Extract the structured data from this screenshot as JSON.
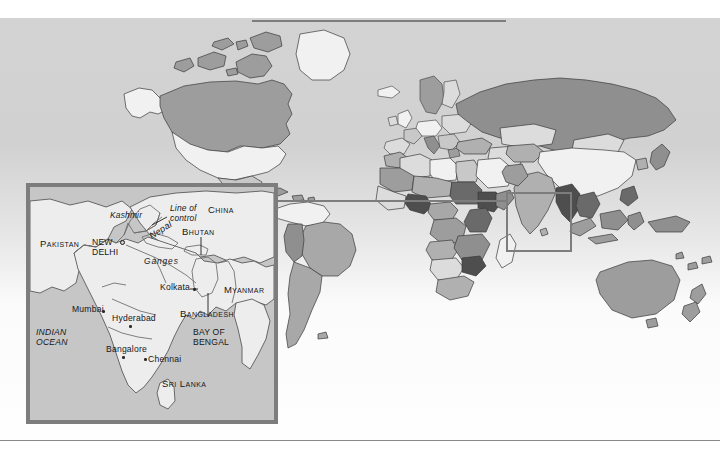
{
  "figure": {
    "kind": "locator-map-with-inset",
    "background_color": "#fafafa",
    "frame_color": "#7d7d7d"
  },
  "world_map": {
    "name": "world-choropleth",
    "ocean_color": "#e8e8e8",
    "outline_color": "#3a3a3a",
    "highlight_box": {
      "label": "south-asia-highlight",
      "x": 506,
      "y": 174,
      "w": 66,
      "h": 60,
      "color": "#7d7d7d"
    },
    "connector": {
      "label": "inset-connector-line",
      "color": "#7d7d7d"
    },
    "shades": {
      "lightest": "#f2f2f2",
      "light": "#dcdcdc",
      "medium": "#b4b4b4",
      "dark": "#8e8e8e",
      "darkest": "#6a6a6a"
    }
  },
  "inset": {
    "title": "South Asia detail",
    "land_color": "#efefef",
    "sea_color": "#c6c6c6",
    "border_color": "#7d7d7d",
    "labels": [
      {
        "id": "pakistan",
        "text": "Pakistan",
        "style": "caps",
        "x": 10,
        "y": 57
      },
      {
        "id": "kashmir",
        "text": "Kashmir",
        "style": "ital",
        "x": 82,
        "y": 28
      },
      {
        "id": "line-of-control",
        "text": "Line of\ncontrol",
        "style": "ital",
        "x": 139,
        "y": 20
      },
      {
        "id": "china",
        "text": "China",
        "style": "caps",
        "x": 177,
        "y": 21
      },
      {
        "id": "new-delhi",
        "text": "NEW\nDELHI",
        "style": "plain",
        "x": 64,
        "y": 53
      },
      {
        "id": "nepal",
        "text": "Nepal",
        "style": "ital",
        "x": 121,
        "y": 50
      },
      {
        "id": "bhutan",
        "text": "Bhutan",
        "style": "caps",
        "x": 160,
        "y": 44
      },
      {
        "id": "ganges",
        "text": "Ganges",
        "style": "ital",
        "x": 119,
        "y": 72
      },
      {
        "id": "kolkata",
        "text": "Kolkata",
        "style": "plain",
        "x": 134,
        "y": 98
      },
      {
        "id": "myanmar",
        "text": "Myanmar",
        "style": "caps",
        "x": 196,
        "y": 102
      },
      {
        "id": "bangladesh",
        "text": "Bangladesh",
        "style": "caps",
        "x": 156,
        "y": 125
      },
      {
        "id": "mumbai",
        "text": "Mumbai",
        "style": "plain",
        "x": 44,
        "y": 119
      },
      {
        "id": "hyderabad",
        "text": "Hyderabad",
        "style": "plain",
        "x": 85,
        "y": 127
      },
      {
        "id": "indian-ocean",
        "text": "INDIAN\nOCEAN",
        "style": "plain",
        "x": 6,
        "y": 143
      },
      {
        "id": "bay-of-bengal",
        "text": "BAY OF\nBENGAL",
        "style": "plain",
        "x": 166,
        "y": 143
      },
      {
        "id": "bangalore",
        "text": "Bangalore",
        "style": "plain",
        "x": 79,
        "y": 159
      },
      {
        "id": "chennai",
        "text": "Chennai",
        "style": "plain",
        "x": 119,
        "y": 170
      },
      {
        "id": "sri-lanka",
        "text": "Sri Lanka",
        "style": "caps",
        "x": 134,
        "y": 194
      }
    ],
    "city_dots": [
      {
        "id": "new-delhi-capital",
        "x": 89,
        "y": 57,
        "type": "capital"
      },
      {
        "id": "kolkata-dot",
        "x": 163,
        "y": 102,
        "type": "city"
      },
      {
        "id": "mumbai-dot",
        "x": 72,
        "y": 124,
        "type": "city"
      },
      {
        "id": "hyderabad-dot",
        "x": 99,
        "y": 138,
        "type": "city"
      },
      {
        "id": "bangalore-dot",
        "x": 92,
        "y": 170,
        "type": "city"
      },
      {
        "id": "chennai-dot",
        "x": 114,
        "y": 172,
        "type": "city"
      }
    ]
  }
}
